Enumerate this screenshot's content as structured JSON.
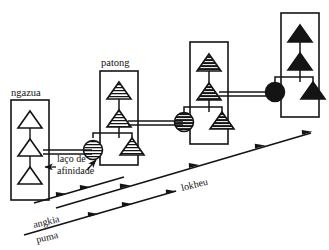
{
  "figure": {
    "type": "kinship-diagram",
    "background_color": "#ffffff",
    "ink_color": "#141414"
  },
  "groups": [
    {
      "id": "group-1",
      "label": "ngazua",
      "fill_style": "white",
      "box": {
        "x": 11,
        "y": 100,
        "w": 38,
        "h": 100
      },
      "label_pos": {
        "x": 11,
        "y": 96
      },
      "triangles": [
        {
          "cx": 30,
          "cy": 124,
          "shade": "white"
        },
        {
          "cx": 30,
          "cy": 152,
          "shade": "white"
        },
        {
          "cx": 30,
          "cy": 180,
          "shade": "white"
        }
      ],
      "circle": null
    },
    {
      "id": "group-2",
      "label": "patong",
      "fill_style": "hatched-light",
      "box": {
        "x": 100,
        "y": 71,
        "w": 38,
        "h": 94
      },
      "label_pos": {
        "x": 101,
        "y": 66
      },
      "triangles": [
        {
          "cx": 119,
          "cy": 95,
          "shade": "hatched-light"
        },
        {
          "cx": 119,
          "cy": 123,
          "shade": "hatched-light"
        },
        {
          "cx": 119,
          "cy": 151,
          "shade": "hatched-light"
        }
      ],
      "circle": {
        "cx": 93,
        "cy": 150,
        "shade": "hatched-light"
      }
    },
    {
      "id": "group-3",
      "label": "",
      "fill_style": "hatched-dark",
      "box": {
        "x": 190,
        "y": 42,
        "w": 38,
        "h": 102
      },
      "label_pos": null,
      "triangles": [
        {
          "cx": 209,
          "cy": 67,
          "shade": "hatched-dark"
        },
        {
          "cx": 209,
          "cy": 96,
          "shade": "hatched-dark"
        },
        {
          "cx": 209,
          "cy": 125,
          "shade": "hatched-dark"
        }
      ],
      "circle": {
        "cx": 184,
        "cy": 122,
        "shade": "hatched-dark"
      }
    },
    {
      "id": "group-4",
      "label": "",
      "fill_style": "solid",
      "box": {
        "x": 281,
        "y": 13,
        "w": 38,
        "h": 104
      },
      "label_pos": null,
      "triangles": [
        {
          "cx": 300,
          "cy": 38,
          "shade": "solid"
        },
        {
          "cx": 300,
          "cy": 66,
          "shade": "solid"
        },
        {
          "cx": 300,
          "cy": 94,
          "shade": "solid"
        }
      ],
      "circle": {
        "cx": 275,
        "cy": 92,
        "shade": "solid"
      }
    }
  ],
  "marriage_links": [
    {
      "from": "group-1",
      "to": "group-2",
      "x1": 49,
      "x2": 92,
      "y": 152
    },
    {
      "from": "group-2",
      "to": "group-3",
      "x1": 131,
      "x2": 183,
      "y": 123
    },
    {
      "from": "group-3",
      "to": "group-4",
      "x1": 222,
      "x2": 274,
      "y": 94
    }
  ],
  "annotations": {
    "affinity_tie": {
      "line1": "laço de",
      "line2": "afinidade",
      "line1_pos": {
        "x": 57,
        "y": 161
      },
      "line2_pos": {
        "x": 57,
        "y": 173
      },
      "arrow_left": {
        "x1": 57,
        "y1": 168,
        "x2": 46,
        "y2": 168
      },
      "arrow_right": {
        "x1": 86,
        "y1": 168,
        "x2": 96,
        "y2": 159
      }
    }
  },
  "axes": [
    {
      "id": "axis-upper",
      "label": "lokheu",
      "label_pos": {
        "x": 182,
        "y": 191
      },
      "label_rotation": -13.5,
      "x1": 56,
      "y1": 208,
      "x2": 311,
      "y2": 133,
      "arrow_marks": [
        0.27,
        0.54,
        0.8,
        1.0
      ]
    },
    {
      "id": "axis-lower",
      "label": "angkia",
      "label_pos": {
        "x": 34,
        "y": 228
      },
      "label_rotation": -13.5,
      "sub_label": "puma",
      "sub_label_pos": {
        "x": 37,
        "y": 242
      },
      "x1": 24,
      "y1": 235,
      "x2": 176,
      "y2": 191,
      "arrow_marks": [
        0.46,
        0.72,
        1.0
      ]
    }
  ],
  "legend_terms": {
    "ngazua": "ngazua",
    "patong": "patong",
    "lokheu": "lokheu",
    "angkia": "angkia",
    "puma": "puma",
    "laco_de": "laço de",
    "afinidade": "afinidade"
  }
}
